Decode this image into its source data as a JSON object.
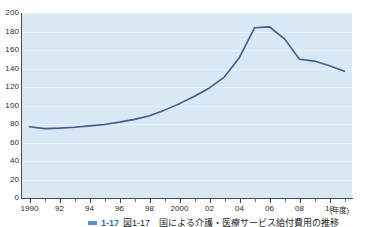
{
  "figure": {
    "background": "#ffffff",
    "plot_background": "#d9e8f5",
    "gridline_color": "#eaf3fa",
    "line_color": "#3d5d8f",
    "axis_color": "#4a4a4a"
  },
  "axes": {
    "x_unit_label": "(年度)",
    "y_ticks": [
      "200",
      "180",
      "160",
      "140",
      "120",
      "100",
      "80",
      "60",
      "40",
      "20",
      "0"
    ],
    "x_ticks": [
      "1990",
      "92",
      "94",
      "96",
      "98",
      "2000",
      "02",
      "04",
      "06",
      "08",
      "10"
    ]
  },
  "caption": {
    "marker": "legend-swatch",
    "number": "1-17",
    "text": "図1-17　国による介護・医療サービス給付費用の推移"
  },
  "chart_data": {
    "type": "line",
    "title": "",
    "xlabel": "(年度)",
    "ylabel": "",
    "xlim": [
      1989.5,
      2011.5
    ],
    "ylim": [
      0,
      200
    ],
    "ytick_step": 20,
    "grid": true,
    "legend": "none",
    "x": [
      1990,
      1991,
      1992,
      1993,
      1994,
      1995,
      1996,
      1997,
      1998,
      1999,
      2000,
      2001,
      2002,
      2003,
      2004,
      2005,
      2006,
      2007,
      2008,
      2009,
      2010,
      2011
    ],
    "series": [
      {
        "name": "給付費用",
        "values": [
          77,
          75,
          75.5,
          76.5,
          78,
          79.5,
          82,
          85,
          89,
          95,
          102,
          110,
          119,
          131,
          152,
          184,
          185,
          172,
          150,
          148,
          143,
          137
        ]
      }
    ]
  }
}
